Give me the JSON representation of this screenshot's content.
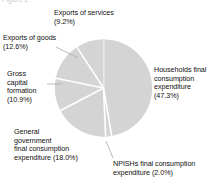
{
  "clipped_title_fragment": "Figure 2",
  "chart_data": {
    "type": "pie",
    "title": "",
    "subtitle": "",
    "xlabel": "",
    "ylabel": "",
    "legend_position": "none",
    "grid": false,
    "unit": "%",
    "start_angle_deg": 0,
    "direction": "clockwise",
    "slice_color": "#d4d4d4",
    "separator_color": "#ffffff",
    "leader_line_color": "#a8a8a8",
    "categories": [
      "Households final consumption expenditure",
      "NPISHs final consumption expenditure",
      "General government final consumption expenditure",
      "Gross capital formation",
      "Exports of goods",
      "Exports of services"
    ],
    "values": [
      47.3,
      2.0,
      18.0,
      10.9,
      12.6,
      9.2
    ],
    "slices": [
      {
        "key": "households",
        "name": "Households final consumption expenditure",
        "value": 47.3,
        "value_label": "(47.3%)",
        "label_lines": [
          "Households final",
          "consumption",
          "expenditure",
          "(47.3%)"
        ]
      },
      {
        "key": "npishs",
        "name": "NPISHs final consumption expenditure",
        "value": 2.0,
        "value_label": "(2.0%)",
        "label_lines": [
          "NPISHs final consumption",
          "expenditure (2.0%)"
        ]
      },
      {
        "key": "general_government",
        "name": "General government final consumption expenditure",
        "value": 18.0,
        "value_label": "(18.0%)",
        "label_lines": [
          "General",
          "government",
          "final consumption",
          "expenditure (18.0%)"
        ]
      },
      {
        "key": "gross_capital_formation",
        "name": "Gross capital formation",
        "value": 10.9,
        "value_label": "(10.9%)",
        "label_lines": [
          "Gross",
          "capital",
          "formation",
          "(10.9%)"
        ]
      },
      {
        "key": "exports_of_goods",
        "name": "Exports of goods",
        "value": 12.6,
        "value_label": "(12.6%)",
        "label_lines": [
          "Exports of goods",
          "(12.6%)"
        ]
      },
      {
        "key": "exports_of_services",
        "name": "Exports of services",
        "value": 9.2,
        "value_label": "(9.2%)",
        "label_lines": [
          "Exports of services",
          "(9.2%)"
        ]
      }
    ]
  },
  "labels": {
    "exports_services": "Exports of services\n(9.2%)",
    "exports_goods": "Exports of goods\n(12.6%)",
    "gross_capital": "Gross\ncapital\nformation\n(10.9%)",
    "general_government": "General\ngovernment\nfinal consumption\nexpenditure (18.0%)",
    "households": "Households final\nconsumption\nexpenditure\n(47.3%)",
    "npishs": "NPISHs final consumption\nexpenditure (2.0%)"
  }
}
